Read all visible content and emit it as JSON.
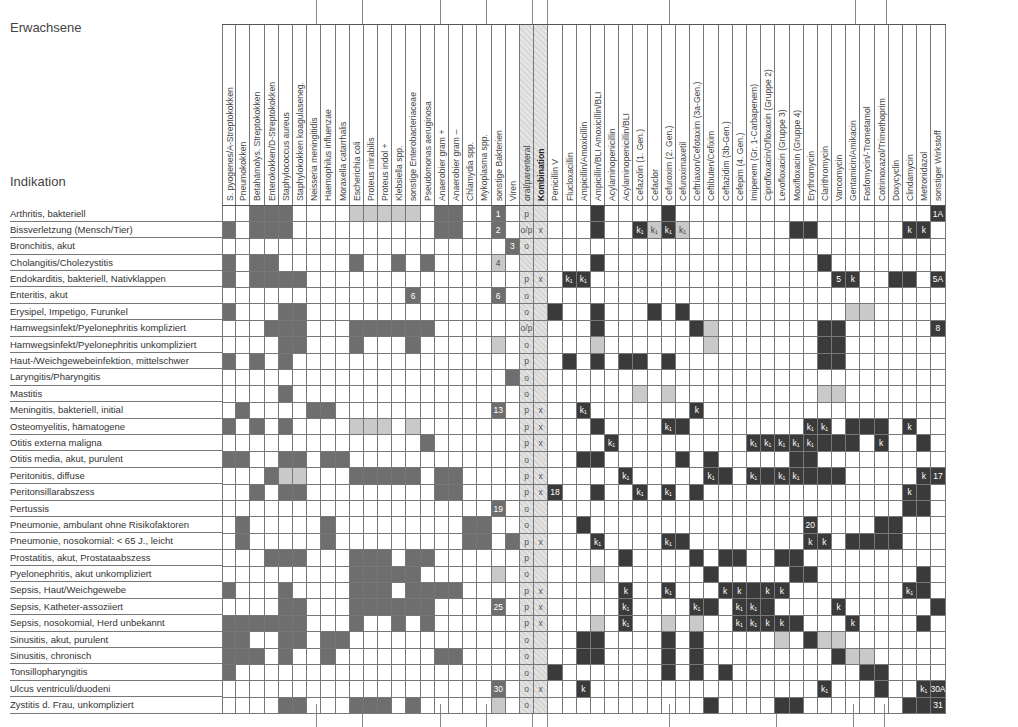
{
  "page": {
    "section_title": "Erwachsene",
    "row_header": "Indikation"
  },
  "columns": [
    "S. pyogenes/A-Streptokokken",
    "Pneumokokken",
    "Betahämolys. Streptokokken",
    "Enterokokken/D-Streptokokken",
    "Staphylococcus aureus",
    "Staphylokokken koagulaseneg.",
    "Neisseria meningitidis",
    "Haemophilus influenzae",
    "Moraxella catarrhalis",
    "Escherichia coli",
    "Proteus mirabilis",
    "Proteus indol +",
    "Klebsiella spp.",
    "sonstige Enterobacteriaceae",
    "Pseudomonas aeruginosa",
    "Anaerobier gram +",
    "Anaerobier gram –",
    "Chlamydia spp.",
    "Mykoplasma spp.",
    "sonstige Bakterien",
    "Viren",
    "oral/parenteral",
    "Kombination",
    "Penicillin V",
    "Flucloxacillin",
    "Ampicillin/Amoxicillin",
    "Ampicillin/BLI   Amoxicillin/BLI",
    "Acylaminopenicillin",
    "Acylaminopenicillin/BLI",
    "Cefazolin (1. Gen.)",
    "Cefaclor",
    "Cefuroxim (2. Gen.)",
    "Cefuroximaxetil",
    "Ceftriaxon/Cefotaxim (3a-Gen.)",
    "Ceftibuten/Cefixim",
    "Ceftazidim (3b-Gen.)",
    "Cefepim (4. Gen.)",
    "Imipenem (Gr. 1-Carbapenem)",
    "Ciprofloxacin/Ofloxacin (Gruppe 2)",
    "Levofloxacin (Gruppe 3)",
    "Moxifloxacin (Gruppe 4)",
    "Erythromycin",
    "Clarithromycin",
    "Vancomycin",
    "Gentamicin/Amikacin",
    "Fosfomycin/-Trometamol",
    "Cotrimoxazol/Trimethoprim",
    "Doxycyclin",
    "Clindamycin",
    "Metronidazol",
    "sonstiger Wirkstoff"
  ],
  "legend": {
    "M": "organism relevant (medium gray)",
    "L": "light gray / limited",
    "D": "drug recommended (dark)",
    "H": "hatched column background"
  },
  "rows": [
    {
      "label": "Arthritis, bakteriell",
      "cells": "..MMM....LLLLL.MM..M.",
      "op": "p",
      "komb": "",
      "drug": "...D....D...................D.",
      "notes": {
        "19": "1",
        "50": "1A"
      }
    },
    {
      "label": "Bissverletzung (Mensch/Tier)",
      "cells": "M.MMM..........MM..M.",
      "op": "o/p",
      "komb": "x",
      "drug": "...D..DLDL.......DD..........LL.",
      "notes": {
        "19": "2",
        "29": "k1",
        "30": "k1",
        "31": "k1",
        "32": "k1",
        "48": "k",
        "49": "k"
      }
    },
    {
      "label": "Bronchitis, akut",
      "cells": "....................M",
      "op": "o",
      "komb": "",
      "drug": "",
      "notes": {
        "20": "3"
      }
    },
    {
      "label": "Cholangitis/Cholezystitis",
      "cells": "M.MM.....M..M.M....L.",
      "op": "",
      "komb": "",
      "drug": "...D...............D",
      "notes": {
        "19": "4"
      }
    },
    {
      "label": "Endokarditis, bakteriell, Nativklappen",
      "cells": "M.MMMM...............",
      "op": "p",
      "komb": "x",
      "drug": ".DD.....................DD.....D",
      "notes": {
        "24": "k1",
        "25": "k1",
        "43": "5",
        "44": "k",
        "50": "5A"
      }
    },
    {
      "label": "Enteritis, akut",
      "cells": ".............M.....M.",
      "op": "o",
      "komb": "",
      "drug": "",
      "notes": {
        "13": "6",
        "19": "6"
      }
    },
    {
      "label": "Erysipel, Impetigo, Furunkel",
      "cells": "M...MM...............",
      "op": "o",
      "komb": "",
      "drug": "D..D...D.D...........LL......D",
      "notes": {}
    },
    {
      "label": "Harnwegsinfekt/Pyelonephritis kompliziert",
      "cells": "...MMM...MMMMMM......",
      "op": "o/p",
      "komb": "",
      "drug": "...D......DL.......DD.......D..D",
      "notes": {
        "50": "8"
      }
    },
    {
      "label": "Harnwegsinfekt/Pyelonephritis unkompliziert",
      "cells": "....MM...M...M.....L.",
      "op": "o",
      "komb": "",
      "drug": "...L.......L.......DD.......D",
      "notes": {}
    },
    {
      "label": "Haut-/Weichgewebeinfektion, mittelschwer",
      "cells": "M.M.M................",
      "op": "p",
      "komb": "",
      "drug": ".D.D.DD.D..........DD.......D",
      "notes": {}
    },
    {
      "label": "Laryngitis/Pharyngitis",
      "cells": "....................M",
      "op": "o",
      "komb": "",
      "drug": "",
      "notes": {}
    },
    {
      "label": "Mastitis",
      "cells": "....M................",
      "op": "o",
      "komb": "",
      "drug": "......L.L..........LL.......L",
      "notes": {}
    },
    {
      "label": "Meningitis, bakteriell, initial",
      "cells": ".M....MM...........M.",
      "op": "p",
      "komb": "x",
      "drug": "..D.......D",
      "notes": {
        "19": "13",
        "25": "k1",
        "33": "k"
      }
    },
    {
      "label": "Osteomyelitis, hämatogene",
      "cells": "M.M.M....LLL.L.......",
      "op": "p",
      "komb": "x",
      "drug": "...D.....D...........DDD.......D",
      "notes": {
        "31": "k1",
        "41": "k1",
        "42": "k1",
        "48": "k"
      }
    },
    {
      "label": "Otitis externa maligna",
      "cells": "..............M......",
      "op": "p",
      "komb": "x",
      "drug": "....D............DDDDD....D",
      "notes": {
        "27": "k1",
        "37": "k1",
        "38": "k1",
        "39": "k1",
        "40": "k1",
        "41": "k1",
        "46": "k"
      }
    },
    {
      "label": "Otitis media, akut, purulent",
      "cells": "MM..MM.MM............",
      "op": "o",
      "komb": "",
      "drug": "..DD.....D.D.....DD",
      "notes": {}
    },
    {
      "label": "Peritonitis, diffuse",
      "cells": "...MLL...MMMMM.MM....",
      "op": "p",
      "komb": "x",
      "drug": ".....D......D..D..DDD.......D.",
      "notes": {
        "28": "k1",
        "34": "k1",
        "37": "k1",
        "39": "k1",
        "40": "k1",
        "49": "k",
        "50": "17"
      }
    },
    {
      "label": "Peritonsillarabszess",
      "cells": "..M.MM.........MM....",
      "op": "p",
      "komb": "x",
      "drug": "D..D..D...D..............DD.....D",
      "notes": {
        "23": "18",
        "29": "k1",
        "31": "k1",
        "48": "k"
      }
    },
    {
      "label": "Pertussis",
      "cells": "...................M.",
      "op": "o",
      "komb": "",
      "drug": ".........................DD......L",
      "notes": {
        "19": "19"
      }
    },
    {
      "label": "Pneumonie, ambulant ohne Risikofaktoren",
      "cells": ".M.....M.........MM..",
      "op": "o",
      "komb": "",
      "drug": "..D....................DD........L",
      "notes": {
        "41": "20"
      }
    },
    {
      "label": "Pneumonie, nosokomial: < 65 J., leicht",
      "cells": ".M.....M.........MM.M",
      "op": "p",
      "komb": "x",
      "drug": "...D.....D...........DDDD",
      "notes": {
        "26": "k1",
        "31": "k1",
        "41": "k",
        "42": "k"
      }
    },
    {
      "label": "Prostatitis, akut, Prostataabszess",
      "cells": "...MMM...MMM.MM......",
      "op": "p",
      "komb": "",
      "drug": ".....D....D.DD..DD",
      "notes": {}
    },
    {
      "label": "Pyelonephritis, akut unkompliziert",
      "cells": ".........MMMMM.....L.",
      "op": "o",
      "komb": "",
      "drug": "...L.......D.....DD.......D",
      "notes": {}
    },
    {
      "label": "Sepsis, Haut/Weichgewebe",
      "cells": "M...M....MMM.MMMM....",
      "op": "p",
      "komb": "x",
      "drug": ".....D..D...DDDDD.........D",
      "notes": {
        "28": "k",
        "31": "k1",
        "35": "k",
        "36": "k",
        "38": "k",
        "39": "k",
        "48": "k1"
      }
    },
    {
      "label": "Sepsis, Katheter-assoziiert",
      "cells": "....MM...MMMMMM....M.",
      "op": "p",
      "komb": "x",
      "drug": ".....D.....D..DD...........D",
      "notes": {
        "19": "25",
        "28": "k1",
        "33": "k1",
        "36": "k1",
        "37": "k1",
        "43": "k"
      }
    },
    {
      "label": "Sepsis, nosokomial, Herd unbekannt",
      "cells": "MMMMMM...M..M.M......",
      "op": "p",
      "komb": "x",
      "drug": "...L.D..L.L...DDDD........D",
      "notes": {
        "28": "k1",
        "36": "k1",
        "37": "k1",
        "38": "k",
        "39": "k",
        "44": "k"
      }
    },
    {
      "label": "Sinusitis, akut, purulent",
      "cells": "MM..MM.MM..........",
      "op": "o",
      "komb": "",
      "drug": "..DD....D.D.....L.DLL",
      "notes": {}
    },
    {
      "label": "Sinusitis, chronisch",
      "cells": "MMM.M..M.......MM....",
      "op": "o",
      "komb": "",
      "drug": "..DD....D.D.........DLL",
      "notes": {}
    },
    {
      "label": "Tonsillopharyngitis",
      "cells": "M....................",
      "op": "o",
      "komb": "",
      "drug": "D.......D.D.D.........DD",
      "notes": {}
    },
    {
      "label": "Ulcus ventriculi/duodeni",
      "cells": "...................M.",
      "op": "o",
      "komb": "x",
      "drug": "..D....................D......D",
      "notes": {
        "19": "30",
        "25": "k",
        "42": "k1",
        "49": "k1",
        "50": "30A"
      }
    },
    {
      "label": "Zystitis d. Frau, unkompliziert",
      "cells": "....MM...MMM.M.....L.",
      "op": "o",
      "komb": "",
      "drug": "...........D....DD.......DD",
      "notes": {
        "50": "31"
      }
    }
  ]
}
